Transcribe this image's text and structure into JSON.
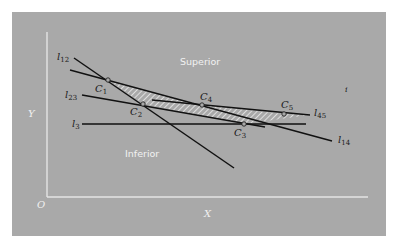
{
  "diagram": {
    "regions": {
      "superior": "Superior",
      "inferior": "Inferior"
    },
    "axes": {
      "origin": "O",
      "x": "X",
      "y": "Y"
    },
    "stray_mark": "i",
    "lines": [
      {
        "id": "l12",
        "name": "l",
        "sub": "12"
      },
      {
        "id": "l23",
        "name": "l",
        "sub": "23"
      },
      {
        "id": "l3",
        "name": "l",
        "sub": "3"
      },
      {
        "id": "l14",
        "name": "l",
        "sub": "14"
      },
      {
        "id": "l45",
        "name": "l",
        "sub": "45"
      }
    ],
    "points": [
      {
        "id": "C1",
        "name": "C",
        "sub": "1"
      },
      {
        "id": "C2",
        "name": "C",
        "sub": "2"
      },
      {
        "id": "C3",
        "name": "C",
        "sub": "3"
      },
      {
        "id": "C4",
        "name": "C",
        "sub": "4"
      },
      {
        "id": "C5",
        "name": "C",
        "sub": "5"
      }
    ],
    "colors": {
      "panel": "#a9a9a9",
      "axis": "#e4e4e4",
      "line": "#111111",
      "hatch": "#e8e8e8"
    }
  }
}
